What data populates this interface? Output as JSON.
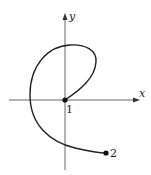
{
  "diagram": {
    "type": "parametric-curve",
    "axes": {
      "x_label": "x",
      "y_label": "y"
    },
    "points": [
      {
        "id": "start",
        "label": "1"
      },
      {
        "id": "end",
        "label": "2"
      }
    ],
    "colors": {
      "axis": "#555555",
      "curve": "#222222",
      "point": "#111111"
    }
  }
}
